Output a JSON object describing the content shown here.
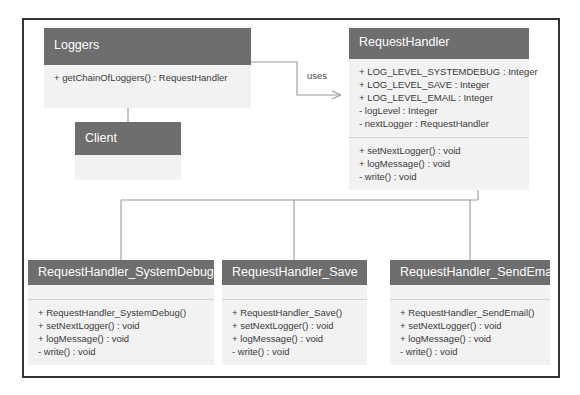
{
  "diagram": {
    "colors": {
      "header_fill": "#6e6e6e",
      "header_text": "#ffffff",
      "body_fill": "#f2f2f2",
      "member_text": "#3b3b3b",
      "connector": "#9a9a9a",
      "frame_border": "#333333"
    }
  },
  "classes": {
    "loggers": {
      "name": "Loggers",
      "attributes": [],
      "methods": [
        "+ getChainOfLoggers() : RequestHandler"
      ]
    },
    "client": {
      "name": "Client",
      "attributes": [],
      "methods": []
    },
    "request_handler": {
      "name": "RequestHandler",
      "attributes": [
        "+ LOG_LEVEL_SYSTEMDEBUG : Integer",
        "+ LOG_LEVEL_SAVE : Integer",
        "+ LOG_LEVEL_EMAIL : Integer",
        "- logLevel : Integer",
        "- nextLogger : RequestHandler"
      ],
      "methods": [
        "+ setNextLogger() : void",
        "+ logMessage() : void",
        "- write() : void"
      ]
    },
    "request_handler_system_debug": {
      "name": "RequestHandler_SystemDebug",
      "attributes": [],
      "methods": [
        "+ RequestHandler_SystemDebug()",
        "+ setNextLogger() : void",
        "+ logMessage() : void",
        "- write() : void"
      ]
    },
    "request_handler_save": {
      "name": "RequestHandler_Save",
      "attributes": [],
      "methods": [
        "+ RequestHandler_Save()",
        "+ setNextLogger() : void",
        "+ logMessage() : void",
        "- write() : void"
      ]
    },
    "request_handler_send_email": {
      "name": "RequestHandler_SendEmail",
      "attributes": [],
      "methods": [
        "+ RequestHandler_SendEmail()",
        "+ setNextLogger() : void",
        "+ logMessage() : void",
        "- write() : void"
      ]
    }
  },
  "relationships": {
    "uses_label": "uses",
    "edges": [
      {
        "from": "Loggers",
        "to": "RequestHandler",
        "type": "dependency",
        "label": "uses"
      },
      {
        "from": "Client",
        "to": "Loggers",
        "type": "generalization",
        "label": ""
      },
      {
        "from": "RequestHandler_SystemDebug",
        "to": "RequestHandler",
        "type": "generalization",
        "label": ""
      },
      {
        "from": "RequestHandler_Save",
        "to": "RequestHandler",
        "type": "generalization",
        "label": ""
      },
      {
        "from": "RequestHandler_SendEmail",
        "to": "RequestHandler",
        "type": "generalization",
        "label": ""
      }
    ]
  }
}
